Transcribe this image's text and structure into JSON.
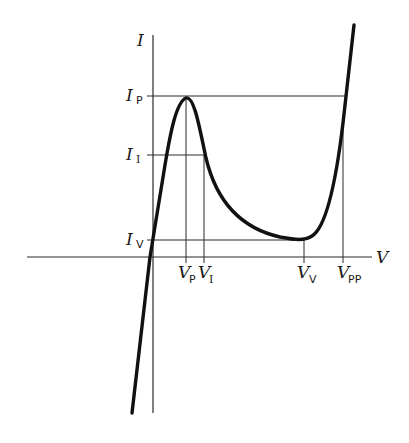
{
  "diagram": {
    "axes": {
      "x_label": "V",
      "y_label": "I"
    },
    "current_labels": [
      {
        "main": "I",
        "sub": "P",
        "name": "peak-current"
      },
      {
        "main": "I",
        "sub": "I",
        "name": "inflection-current"
      },
      {
        "main": "I",
        "sub": "V",
        "name": "valley-current"
      }
    ],
    "voltage_labels": [
      {
        "main": "V",
        "sub": "P",
        "name": "peak-voltage"
      },
      {
        "main": "V",
        "sub": "I",
        "name": "inflection-voltage"
      },
      {
        "main": "V",
        "sub": "V",
        "name": "valley-voltage"
      },
      {
        "main": "V",
        "sub": "PP",
        "name": "projected-peak-voltage"
      }
    ],
    "colors": {
      "curve": "#111111",
      "guides": "#2a2a2a",
      "background": "#ffffff"
    }
  }
}
